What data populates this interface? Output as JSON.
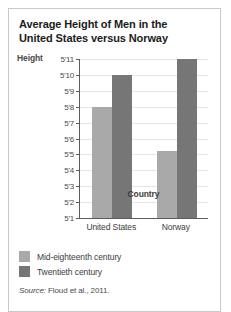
{
  "figure": {
    "title": "Average Height of Men in the United States versus Norway",
    "title_line1": "Average Height of Men in the",
    "title_line2": "United States versus Norway",
    "source_prefix": "Source:",
    "source_text": " Floud et al., 2011.",
    "border_color": "#c9c9c9",
    "background": "#ffffff"
  },
  "chart_data": {
    "type": "bar",
    "title": "Average Height of Men in the United States versus Norway",
    "subtitle": "",
    "xlabel": "Country",
    "ylabel": "Height",
    "categories": [
      "United States",
      "Norway"
    ],
    "series": [
      {
        "name": "Mid-eighteenth century",
        "color": "#a9a9a9",
        "values": [
          68,
          65.2
        ],
        "value_labels": [
          "5'8",
          "5'5"
        ]
      },
      {
        "name": "Twentieth century",
        "color": "#767676",
        "values": [
          70,
          71
        ],
        "value_labels": [
          "5'10",
          "5'11"
        ]
      }
    ],
    "ylim": [
      61,
      71
    ],
    "ytick_values": [
      61,
      62,
      63,
      64,
      65,
      66,
      67,
      68,
      69,
      70,
      71
    ],
    "ytick_labels": [
      "5'1",
      "5'2",
      "5'3",
      "5'4",
      "5'5",
      "5'6",
      "5'7",
      "5'8",
      "5'9",
      "5'10",
      "5'11"
    ],
    "unit": "inches",
    "grid": true,
    "legend_position": "below"
  },
  "legend": {
    "items": [
      {
        "label": "Mid-eighteenth century",
        "color": "#a9a9a9"
      },
      {
        "label": "Twentieth century",
        "color": "#767676"
      }
    ]
  }
}
